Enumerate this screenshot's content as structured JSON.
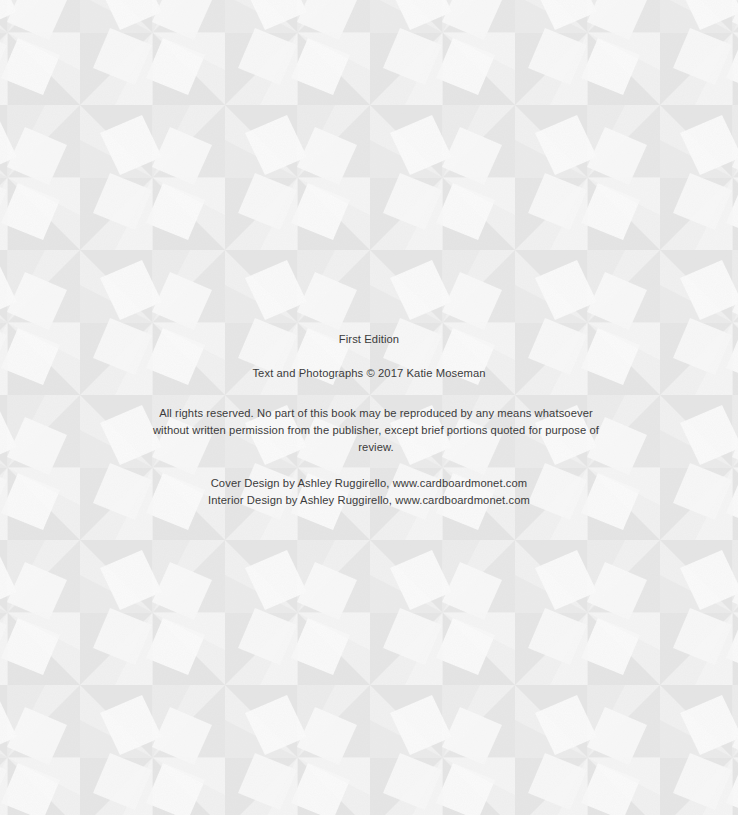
{
  "page": {
    "type": "copyright-page",
    "background": {
      "pattern": "pinwheel-quilt-tiles",
      "base_color": "#f3f3f3",
      "shade_color": "#dcdcdc",
      "light_color": "#fbfbfb",
      "cell_size": 145
    },
    "text_color": "#3b3b3b"
  },
  "copyright": {
    "edition": "First Edition",
    "copyright_line": "Text and Photographs © 2017 Katie Moseman",
    "rights_statement": "All rights reserved.  No part of this book may be reproduced by any means whatsoever without written permission from the publisher, except brief portions quoted for purpose of review.",
    "cover_design": "Cover Design by Ashley Ruggirello, www.cardboardmonet.com",
    "interior_design": "Interior Design by Ashley Ruggirello, www.cardboardmonet.com"
  }
}
